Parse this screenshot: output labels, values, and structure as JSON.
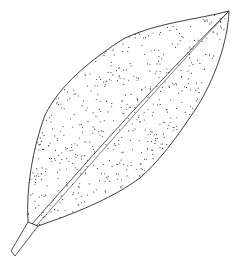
{
  "image": {
    "subject": "Stippled botanical line drawing of a single lanceolate leaf",
    "orientation": "diagonal, petiole at lower-left, apex at upper-right",
    "colors": {
      "background": "#ffffff",
      "ink": "#2a2a2a"
    }
  }
}
